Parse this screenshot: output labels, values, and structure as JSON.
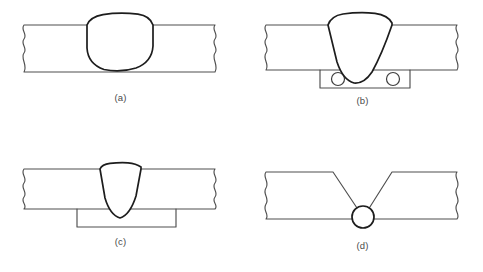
{
  "figure": {
    "panel_count": 4,
    "line_color": "#4e4e4e",
    "weld_outline_color": "#1d1d1d",
    "hatch_color": "#2a2a2a",
    "background_color": "#ffffff",
    "caption_color": "#4a4a4a"
  },
  "panels": [
    {
      "id": "a",
      "caption": "(a)",
      "description": "Full penetration weld with rounded convex bead in plain butt plate",
      "weld_shape": "rounded-dome",
      "has_backing_strip": false,
      "has_backing_bracket": false,
      "has_vee_groove": false,
      "hatch_angle_deg": 45,
      "plate": {
        "top": 25,
        "bottom": 72,
        "left_break_x": 24,
        "right_break_x": 215
      },
      "weld": {
        "center_x": 120,
        "top": 14,
        "bottom": 70,
        "half_width": 33
      }
    },
    {
      "id": "b",
      "caption": "(b)",
      "description": "Weld with perforated backing strip beneath the joint",
      "weld_shape": "teardrop-triangular",
      "has_backing_strip": true,
      "has_backing_bracket": false,
      "has_vee_groove": false,
      "hatch_angle_deg": 45,
      "plate": {
        "top": 25,
        "bottom": 70,
        "left_break_x": 24,
        "right_break_x": 215
      },
      "weld": {
        "center_x": 118,
        "top": 13,
        "bottom": 83,
        "half_width": 32
      },
      "backing_strip": {
        "left": 78,
        "right": 168,
        "top": 70,
        "bottom": 88
      },
      "holes": [
        {
          "cx": 96,
          "cy": 79,
          "r": 6.5
        },
        {
          "cx": 151,
          "cy": 79,
          "r": 6.5
        }
      ]
    },
    {
      "id": "c",
      "caption": "(c)",
      "description": "Narrow deep penetration weld over an open backing bracket",
      "weld_shape": "narrow-teardrop",
      "has_backing_strip": false,
      "has_backing_bracket": true,
      "has_vee_groove": false,
      "hatch_angle_deg": 45,
      "plate": {
        "top": 33,
        "bottom": 73,
        "left_break_x": 24,
        "right_break_x": 215
      },
      "weld": {
        "center_x": 120,
        "top": 27,
        "bottom": 82,
        "half_width": 21
      },
      "bracket": {
        "left": 77,
        "right": 176,
        "top": 73,
        "bottom": 91
      }
    },
    {
      "id": "d",
      "caption": "(d)",
      "description": "Double-bevel vee groove converging on small circular weld nugget at root",
      "weld_shape": "circle-nugget",
      "has_backing_strip": false,
      "has_backing_bracket": false,
      "has_vee_groove": true,
      "hatch_angle_deg": 45,
      "plate": {
        "top": 36,
        "bottom": 83,
        "left_break_x": 24,
        "right_break_x": 215
      },
      "vee": {
        "left_shoulder_x": 91,
        "right_shoulder_x": 132,
        "root_x": 121,
        "root_y": 81
      },
      "nugget": {
        "cx": 121,
        "cy": 81,
        "r": 11
      }
    }
  ]
}
